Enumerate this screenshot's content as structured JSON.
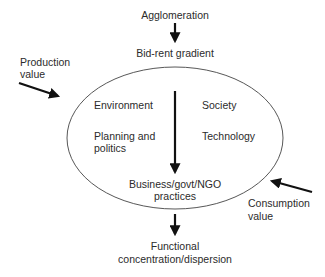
{
  "diagram": {
    "top_input": "Agglomeration",
    "top_factor": "Bid-rent gradient",
    "left_input": {
      "line1": "Production",
      "line2": "value"
    },
    "right_input": {
      "line1": "Consumption",
      "line2": "value"
    },
    "inner_factors": {
      "environment": "Environment",
      "society": "Society",
      "planning": {
        "line1": "Planning and",
        "line2": "politics"
      },
      "technology": "Technology"
    },
    "practices": {
      "line1_prefix": "Business/govt/",
      "line1_abbr": "NGO",
      "line2": "practices"
    },
    "output": {
      "line1": "Functional",
      "line2": "concentration/dispersion"
    },
    "colors": {
      "line": "#333333",
      "arrow": "#111111",
      "text": "#2b2b2b"
    }
  }
}
